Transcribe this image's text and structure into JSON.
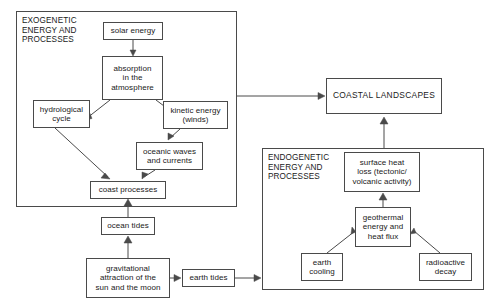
{
  "diagram": {
    "line_color": "#4a4a4a",
    "text_color": "#1a1a1a",
    "background": "#ffffff",
    "groups": [
      {
        "id": "exogenetic",
        "label": "EXOGENETIC\nENERGY AND\nPROCESSES",
        "x": 16,
        "y": 11,
        "w": 221,
        "h": 196
      },
      {
        "id": "endogenetic",
        "label": "ENDOGENETIC\nENERGY AND\nPROCESSES",
        "x": 262,
        "y": 148,
        "w": 222,
        "h": 142
      }
    ],
    "nodes": [
      {
        "id": "solar_energy",
        "label": "solar energy",
        "x": 103,
        "y": 22,
        "w": 60,
        "h": 18
      },
      {
        "id": "absorption",
        "label": "absorption\nin the\natmosphere",
        "x": 102,
        "y": 56,
        "w": 61,
        "h": 44
      },
      {
        "id": "hydrological",
        "label": "hydrological\ncycle",
        "x": 33,
        "y": 100,
        "w": 57,
        "h": 28
      },
      {
        "id": "kinetic_energy",
        "label": "kinetic energy\n(winds)",
        "x": 163,
        "y": 101,
        "w": 65,
        "h": 28
      },
      {
        "id": "oceanic_waves",
        "label": "oceanic waves\nand currents",
        "x": 136,
        "y": 142,
        "w": 67,
        "h": 28
      },
      {
        "id": "coast_processes",
        "label": "coast processes",
        "x": 90,
        "y": 181,
        "w": 76,
        "h": 18
      },
      {
        "id": "ocean_tides",
        "label": "ocean tides",
        "x": 101,
        "y": 217,
        "w": 54,
        "h": 18
      },
      {
        "id": "gravitational",
        "label": "gravitational\nattraction of the\nsun and the moon",
        "x": 86,
        "y": 258,
        "w": 84,
        "h": 40
      },
      {
        "id": "earth_tides",
        "label": "earth tides",
        "x": 182,
        "y": 269,
        "w": 53,
        "h": 18
      },
      {
        "id": "coastal_landscapes",
        "label": "COASTAL LANDSCAPES",
        "x": 326,
        "y": 78,
        "w": 116,
        "h": 36,
        "caps": true
      },
      {
        "id": "surface_heat_loss",
        "label": "surface heat\nloss (tectonic/\nvolcanic activity)",
        "x": 344,
        "y": 152,
        "w": 76,
        "h": 40
      },
      {
        "id": "geothermal",
        "label": "geothermal\nenergy and\nheat flux",
        "x": 355,
        "y": 207,
        "w": 56,
        "h": 40
      },
      {
        "id": "earth_cooling",
        "label": "earth\ncooling",
        "x": 301,
        "y": 253,
        "w": 42,
        "h": 28
      },
      {
        "id": "radioactive_decay",
        "label": "radioactive\ndecay",
        "x": 419,
        "y": 253,
        "w": 53,
        "h": 28
      }
    ],
    "edges": [
      {
        "id": "solar-to-absorption",
        "from": "solar_energy",
        "to": "absorption",
        "path": "M133,40 L133,54",
        "arrow": "M133,56 L130,50 L136,50 Z"
      },
      {
        "id": "absorption-to-hydrological",
        "from": "absorption",
        "to": "hydrological",
        "path": "M110,100 L87,118",
        "arrow": "M85,120 L90,113.5 L92,118.5 Z"
      },
      {
        "id": "absorption-to-kinetic",
        "from": "absorption",
        "to": "kinetic_energy",
        "path": "M156,100 L180,118",
        "arrow": "M182,120 L174,118.5 L177,113.5 Z"
      },
      {
        "id": "hydrological-to-coast",
        "from": "hydrological",
        "to": "coast_processes",
        "path": "M55,128 L108,177",
        "arrow": "M110,179 L101,178 L105,173 Z"
      },
      {
        "id": "kinetic-to-waves",
        "from": "kinetic_energy",
        "to": "oceanic_waves",
        "path": "M180,129 L170,138",
        "arrow": "M168,140 L168,133 L174,136 Z"
      },
      {
        "id": "waves-to-coast",
        "from": "oceanic_waves",
        "to": "coast_processes",
        "path": "M155,170 L144,177",
        "arrow": "M142,179 L142,172 L148,174 Z"
      },
      {
        "id": "oceantides-to-coast",
        "from": "ocean_tides",
        "to": "coast_processes",
        "path": "M128,217 L128,203",
        "arrow": "M128,199 L124,206 L132,206 Z"
      },
      {
        "id": "gravitational-to-oceantides",
        "from": "gravitational",
        "to": "ocean_tides",
        "path": "M128,258 L128,241",
        "arrow": "M128,236 L124,243 L132,243 Z"
      },
      {
        "id": "gravitational-to-earthtides",
        "from": "gravitational",
        "to": "earth_tides",
        "path": "M170,278 L177,278",
        "arrow": "M181,278 L174,274.5 L174,281.5 Z"
      },
      {
        "id": "earthtides-to-endogenetic",
        "from": "earth_tides",
        "to": "endogenetic",
        "path": "M235,278 L257,278",
        "arrow": "M261,278 L254,274.5 L254,281.5 Z"
      },
      {
        "id": "exogenetic-to-coastal",
        "from": "exogenetic",
        "to": "coastal_landscapes",
        "path": "M237,96 L321,96",
        "arrow": "M325,96 L318,92.5 L318,99.5 Z"
      },
      {
        "id": "endogenetic-to-coastal",
        "from": "endogenetic",
        "to": "coastal_landscapes",
        "path": "M384,148 L384,122",
        "arrow": "M384,117 L380,124 L388,124 Z"
      },
      {
        "id": "geothermal-to-surfaceheat",
        "from": "geothermal",
        "to": "surface_heat_loss",
        "path": "M383,207 L383,198",
        "arrow": "M383,193 L379,200 L387,200 Z"
      },
      {
        "id": "earthcooling-to-geothermal",
        "from": "earth_cooling",
        "to": "geothermal",
        "path": "M327,253 L355,231",
        "arrow": "M351,234 L352,227 L356,232 Z"
      },
      {
        "id": "radioactive-to-geothermal",
        "from": "radioactive_decay",
        "to": "geothermal",
        "path": "M440,253 L414,231",
        "arrow": "M410,234 L414,228 L416,233 Z"
      }
    ]
  }
}
